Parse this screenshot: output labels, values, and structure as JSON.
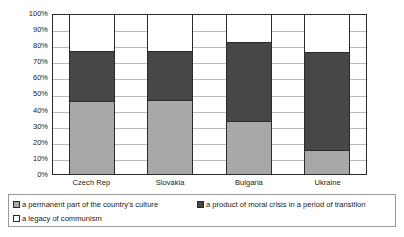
{
  "chart_data": {
    "type": "bar",
    "subtype": "100% stacked column",
    "title": "",
    "subtitle": "",
    "xlabel": "",
    "ylabel": "",
    "categories": [
      "Czech Rep",
      "Slovakia",
      "Bulgaria",
      "Ukraine"
    ],
    "ylim": [
      0,
      100
    ],
    "ytick_labels": [
      "100%",
      "90%",
      "80%",
      "70%",
      "60%",
      "50%",
      "40%",
      "30%",
      "20%",
      "10%",
      "0%"
    ],
    "ytick_values": [
      100,
      90,
      80,
      70,
      60,
      50,
      40,
      30,
      20,
      10,
      0
    ],
    "grid": true,
    "legend_position": "bottom",
    "series": [
      {
        "name": "a permanent part of the country's culture",
        "color": "#a8a8a8",
        "values": [
          45.5,
          46.0,
          33.0,
          14.5
        ]
      },
      {
        "name": "a product of moral crisis in a period of transition",
        "color": "#474747",
        "values": [
          31.5,
          31.0,
          49.5,
          61.5
        ]
      },
      {
        "name": "a legacy of communism",
        "color": "#ffffff",
        "values": [
          23.0,
          23.0,
          17.5,
          24.0
        ]
      }
    ],
    "stack_tops": {
      "a permanent part of the country's culture": [
        45.5,
        46.0,
        33.0,
        14.5
      ],
      "a product of moral crisis in a period of transition": [
        77.0,
        77.0,
        82.5,
        76.0
      ],
      "a legacy of communism": [
        100.0,
        100.0,
        100.0,
        100.0
      ]
    }
  },
  "axis": {
    "ticks": [
      "100%",
      "90%",
      "80%",
      "70%",
      "60%",
      "50%",
      "40%",
      "30%",
      "20%",
      "10%",
      "0%"
    ]
  },
  "categories": [
    {
      "label": "Czech Rep"
    },
    {
      "label": "Slovakia"
    },
    {
      "label": "Bulgaria"
    },
    {
      "label": "Ukraine"
    }
  ],
  "legend": {
    "items": [
      {
        "label": "a permanent part of the country's culture",
        "color": "#a8a8a8",
        "icon": "legend-swatch-icon"
      },
      {
        "label": "a product of moral crisis in a period of transition",
        "color": "#474747",
        "icon": "legend-swatch-icon"
      },
      {
        "label": "a legacy of communism",
        "color": "#ffffff",
        "icon": "legend-swatch-icon"
      }
    ]
  },
  "colors": {
    "series_permanent": "#a8a8a8",
    "series_moral": "#474747",
    "series_legacy": "#ffffff",
    "axis_line": "#2b2b2b",
    "gridline": "#b9b9b9",
    "legend_border": "#9a9a9a",
    "text": "#1a1a1a"
  }
}
